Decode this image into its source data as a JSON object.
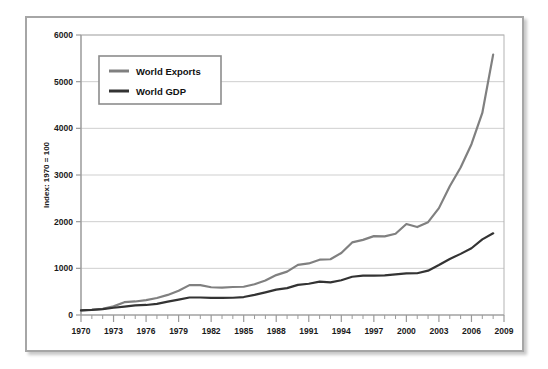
{
  "chart_data": {
    "type": "line",
    "title": "",
    "subtitle": "",
    "xlabel": "",
    "ylabel": "Index: 1970 = 100",
    "xlim": [
      1970,
      2009
    ],
    "ylim": [
      0,
      6000
    ],
    "grid": "horizontal",
    "legend_position": "upper-left-inside",
    "x": [
      1970,
      1971,
      1972,
      1973,
      1974,
      1975,
      1976,
      1977,
      1978,
      1979,
      1980,
      1981,
      1982,
      1983,
      1984,
      1985,
      1986,
      1987,
      1988,
      1989,
      1990,
      1991,
      1992,
      1993,
      1994,
      1995,
      1996,
      1997,
      1998,
      1999,
      2000,
      2001,
      2002,
      2003,
      2004,
      2005,
      2006,
      2007,
      2008
    ],
    "xticks": [
      1970,
      1973,
      1976,
      1979,
      1982,
      1985,
      1988,
      1991,
      1994,
      1997,
      2000,
      2003,
      2006,
      2009
    ],
    "xticklabels": [
      "1970",
      "1973",
      "1976",
      "1979",
      "1982",
      "1985",
      "1988",
      "1991",
      "1994",
      "1997",
      "2000",
      "2003",
      "2006",
      "2009"
    ],
    "yticks": [
      0,
      1000,
      2000,
      3000,
      4000,
      5000,
      6000
    ],
    "yticklabels": [
      "0",
      "1000",
      "2000",
      "3000",
      "4000",
      "5000",
      "6000"
    ],
    "series": [
      {
        "name": "World Exports",
        "color": "#808080",
        "values": [
          100,
          112,
          132,
          185,
          275,
          290,
          320,
          365,
          430,
          520,
          640,
          640,
          595,
          585,
          600,
          605,
          660,
          740,
          855,
          930,
          1075,
          1105,
          1185,
          1195,
          1330,
          1555,
          1610,
          1690,
          1685,
          1740,
          1950,
          1885,
          1990,
          2290,
          2760,
          3160,
          3660,
          4330,
          5580
        ]
      },
      {
        "name": "World GDP",
        "color": "#333333",
        "values": [
          100,
          110,
          125,
          155,
          180,
          205,
          215,
          240,
          285,
          330,
          375,
          375,
          365,
          365,
          370,
          385,
          430,
          485,
          545,
          575,
          645,
          670,
          715,
          700,
          745,
          820,
          845,
          845,
          850,
          870,
          890,
          895,
          950,
          1070,
          1200,
          1310,
          1430,
          1620,
          1750
        ]
      }
    ]
  },
  "legend": {
    "items": [
      {
        "label": "World Exports",
        "swatch_color": "#808080"
      },
      {
        "label": "World GDP",
        "swatch_color": "#333333"
      }
    ]
  },
  "colors": {
    "frame_border": "#a6a6a6",
    "plot_border": "#b3b3b3",
    "gridline": "#c9c9c9",
    "axis": "#9a9a9a",
    "tick_text": "#1a1a1a",
    "exports": "#808080",
    "gdp": "#333333",
    "background": "#ffffff"
  }
}
